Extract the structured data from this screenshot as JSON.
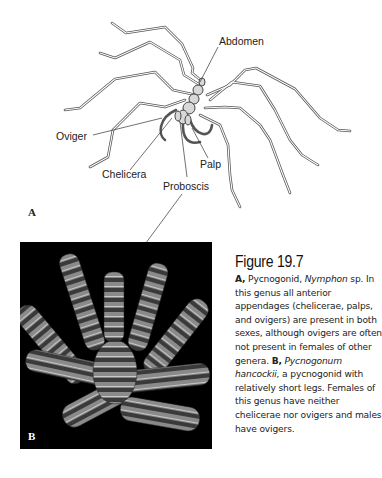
{
  "figure": {
    "panel_a": {
      "letter": "A",
      "labels": {
        "abdomen": "Abdomen",
        "oviger": "Oviger",
        "chelicera": "Chelicera",
        "palp": "Palp",
        "proboscis": "Proboscis"
      }
    },
    "panel_b": {
      "letter": "B"
    },
    "caption": {
      "title": "Figure 19.7",
      "a_marker": "A,",
      "a_text_1": " Pycnogonid, ",
      "a_genus": "Nymphon",
      "a_text_2": " sp. In this genus all anterior appendages (chelicerae, palps, and ovigers) are present in both sexes, although ovigers are often not present in females of other genera. ",
      "b_marker": "B,",
      "b_species": "Pycnogonum hancockii,",
      "b_text": " a pycnogonid with relatively short legs. Females of this genus have neither chelicerae nor ovigers and males have ovigers."
    }
  }
}
